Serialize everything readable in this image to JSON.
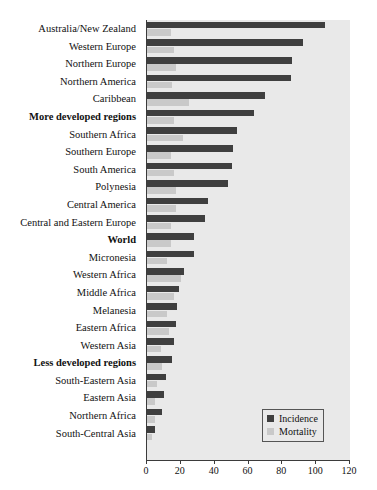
{
  "chart_data": {
    "type": "bar",
    "orientation": "horizontal",
    "title": "",
    "xlabel": "",
    "ylabel": "",
    "xlim": [
      0,
      120
    ],
    "xticks": [
      0,
      20,
      40,
      60,
      80,
      100,
      120
    ],
    "grid": false,
    "legend": {
      "position": "bottom-right",
      "entries": [
        {
          "name": "Incidence",
          "color": "#3f3f3f"
        },
        {
          "name": "Mortality",
          "color": "#c9c9c9"
        }
      ]
    },
    "categories": [
      "Australia/New Zealand",
      "Western Europe",
      "Northern Europe",
      "Northern America",
      "Caribbean",
      "More developed regions",
      "Southern Africa",
      "Southern Europe",
      "South America",
      "Polynesia",
      "Central America",
      "Central and Eastern Europe",
      "World",
      "Micronesia",
      "Western Africa",
      "Middle Africa",
      "Melanesia",
      "Eastern Africa",
      "Western Asia",
      "Less developed regions",
      "South-Eastern Asia",
      "Eastern Asia",
      "Northern Africa",
      "South-Central Asia"
    ],
    "bold_categories": [
      "More developed regions",
      "World",
      "Less developed regions"
    ],
    "series": [
      {
        "name": "Incidence",
        "color": "#3f3f3f",
        "values": [
          105,
          92,
          86,
          85,
          70,
          63,
          53,
          51,
          50,
          48,
          36,
          34,
          28,
          28,
          22,
          19,
          18,
          17,
          16,
          15,
          11,
          10,
          9,
          5
        ]
      },
      {
        "name": "Mortality",
        "color": "#c9c9c9",
        "values": [
          14,
          16,
          17,
          15,
          25,
          16,
          21,
          14,
          16,
          17,
          17,
          14,
          14,
          12,
          20,
          16,
          12,
          13,
          8,
          9,
          6,
          5,
          5,
          3
        ]
      }
    ]
  }
}
